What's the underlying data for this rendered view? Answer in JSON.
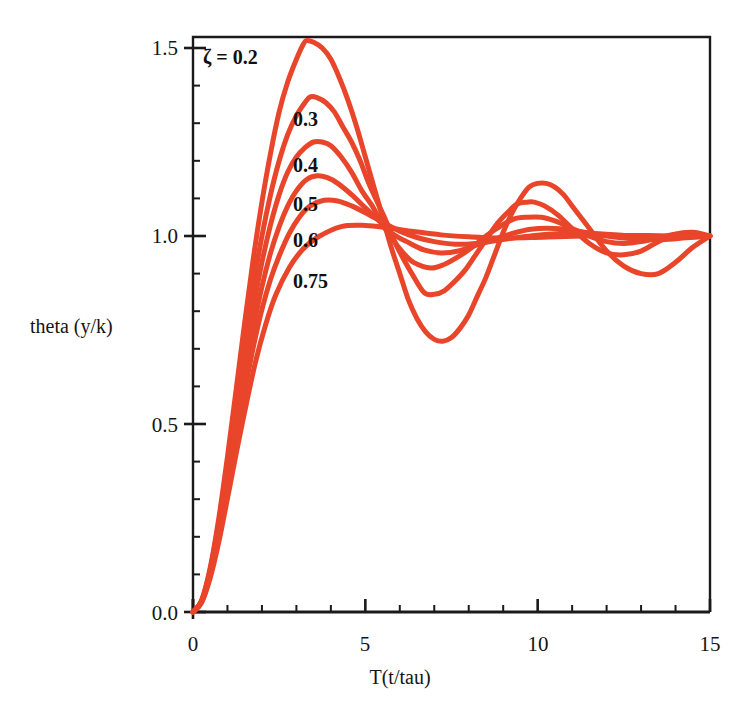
{
  "figure": {
    "background_color": "#ffffff",
    "frame_color": "#1a1a1a",
    "curve_color": "#E8452A"
  },
  "axes": {
    "x_title": "T(t/tau)",
    "y_title": "theta (y/k)",
    "x_ticks": [
      "0",
      "5",
      "10",
      "15"
    ],
    "y_ticks": [
      "0.0",
      "0.5",
      "1.0",
      "1.5"
    ]
  },
  "annotations": {
    "legend_lead": "ζ = 0.2",
    "labels": [
      "0.3",
      "0.4",
      "0.5",
      "0.6",
      "0.75"
    ]
  },
  "chart_data": {
    "type": "line",
    "title": "",
    "xlabel": "T(t/tau)",
    "ylabel": "theta (y/k)",
    "xlim": [
      0,
      15
    ],
    "ylim": [
      0.0,
      1.53
    ],
    "xticks": [
      0,
      5,
      10,
      15
    ],
    "yticks": [
      0.0,
      0.5,
      1.0,
      1.5
    ],
    "x_minor_tick_step": 1,
    "y_minor_tick_step": 0.1,
    "grid": false,
    "legend": "inline-curve-labels",
    "legend_position": "upper-left-inline",
    "color": "#E8452A",
    "line_width": 5,
    "series": [
      {
        "name": "0.2",
        "zeta": 0.2,
        "label": "ζ = 0.2",
        "peak_value": 1.52,
        "peak_time": 3.3,
        "trough_value": 0.72,
        "trough_time": 6.5,
        "second_peak_value": 1.14,
        "second_peak_time": 9.7,
        "x": [
          0,
          0.25,
          0.5,
          0.75,
          1,
          1.25,
          1.5,
          1.75,
          2,
          2.25,
          2.5,
          2.75,
          3,
          3.2,
          3.3,
          3.5,
          3.75,
          4,
          4.25,
          4.5,
          4.75,
          5,
          5.25,
          5.5,
          5.75,
          6,
          6.25,
          6.5,
          6.75,
          7,
          7.25,
          7.5,
          7.75,
          8,
          8.25,
          8.5,
          8.75,
          9,
          9.25,
          9.5,
          9.75,
          10,
          10.25,
          10.5,
          10.75,
          11,
          11.5,
          12,
          12.5,
          13,
          13.5,
          14,
          14.5,
          15
        ],
        "y": [
          0.0,
          0.031,
          0.118,
          0.25,
          0.413,
          0.59,
          0.77,
          0.94,
          1.09,
          1.22,
          1.33,
          1.41,
          1.47,
          1.51,
          1.52,
          1.515,
          1.5,
          1.47,
          1.42,
          1.36,
          1.29,
          1.21,
          1.13,
          1.05,
          0.97,
          0.9,
          0.83,
          0.78,
          0.745,
          0.725,
          0.72,
          0.73,
          0.755,
          0.79,
          0.84,
          0.89,
          0.95,
          1.01,
          1.06,
          1.1,
          1.13,
          1.14,
          1.14,
          1.13,
          1.11,
          1.08,
          1.02,
          0.96,
          0.92,
          0.9,
          0.9,
          0.93,
          0.97,
          1.0
        ]
      },
      {
        "name": "0.3",
        "zeta": 0.3,
        "peak_value": 1.37,
        "peak_time": 3.4,
        "trough_value": 0.84,
        "trough_time": 6.7,
        "second_peak_value": 1.09,
        "second_peak_time": 9.9,
        "x": [
          0,
          0.25,
          0.5,
          0.75,
          1,
          1.25,
          1.5,
          1.75,
          2,
          2.25,
          2.5,
          2.75,
          3,
          3.25,
          3.4,
          3.6,
          3.85,
          4.1,
          4.35,
          4.6,
          4.85,
          5.1,
          5.35,
          5.6,
          5.85,
          6.1,
          6.35,
          6.7,
          7,
          7.3,
          7.6,
          7.9,
          8.2,
          8.5,
          8.8,
          9.1,
          9.4,
          9.7,
          9.9,
          10.2,
          10.6,
          11,
          11.5,
          12,
          12.5,
          13,
          13.5,
          14,
          14.5,
          15
        ],
        "y": [
          0.0,
          0.03,
          0.113,
          0.238,
          0.39,
          0.554,
          0.717,
          0.869,
          1.0,
          1.11,
          1.2,
          1.27,
          1.32,
          1.355,
          1.37,
          1.368,
          1.355,
          1.33,
          1.29,
          1.25,
          1.2,
          1.14,
          1.09,
          1.04,
          0.985,
          0.94,
          0.9,
          0.85,
          0.845,
          0.855,
          0.88,
          0.91,
          0.95,
          0.99,
          1.03,
          1.06,
          1.085,
          1.09,
          1.09,
          1.08,
          1.055,
          1.02,
          0.98,
          0.955,
          0.95,
          0.96,
          0.985,
          1.005,
          1.01,
          1.0
        ]
      },
      {
        "name": "0.4",
        "zeta": 0.4,
        "peak_value": 1.25,
        "peak_time": 3.5,
        "trough_value": 0.915,
        "trough_time": 6.9,
        "second_peak_value": 1.05,
        "second_peak_time": 10.1,
        "x": [
          0,
          0.25,
          0.5,
          0.75,
          1,
          1.25,
          1.5,
          1.75,
          2,
          2.25,
          2.5,
          2.75,
          3,
          3.25,
          3.5,
          3.75,
          4,
          4.3,
          4.6,
          4.9,
          5.2,
          5.5,
          5.8,
          6.1,
          6.4,
          6.9,
          7.3,
          7.7,
          8.1,
          8.5,
          8.9,
          9.3,
          9.7,
          10.1,
          10.5,
          11,
          11.5,
          12,
          12.5,
          13,
          13.5,
          14,
          14.5,
          15
        ],
        "y": [
          0.0,
          0.029,
          0.108,
          0.226,
          0.369,
          0.52,
          0.67,
          0.81,
          0.93,
          1.03,
          1.11,
          1.17,
          1.21,
          1.235,
          1.25,
          1.25,
          1.24,
          1.21,
          1.17,
          1.12,
          1.08,
          1.03,
          0.99,
          0.955,
          0.93,
          0.915,
          0.925,
          0.945,
          0.97,
          1.0,
          1.025,
          1.045,
          1.05,
          1.05,
          1.04,
          1.02,
          1.0,
          0.985,
          0.98,
          0.985,
          0.995,
          1.005,
          1.005,
          1.0
        ]
      },
      {
        "name": "0.5",
        "zeta": 0.5,
        "peak_value": 1.16,
        "peak_time": 3.6,
        "trough_value": 0.955,
        "trough_time": 7.2,
        "second_peak_value": 1.02,
        "second_peak_time": 10.5,
        "x": [
          0,
          0.25,
          0.5,
          0.75,
          1,
          1.25,
          1.5,
          1.75,
          2,
          2.25,
          2.5,
          2.75,
          3,
          3.3,
          3.6,
          3.9,
          4.2,
          4.6,
          5,
          5.4,
          5.8,
          6.2,
          6.7,
          7.2,
          7.7,
          8.2,
          8.7,
          9.2,
          9.8,
          10.5,
          11.2,
          12,
          12.8,
          13.6,
          14.3,
          15
        ],
        "y": [
          0.0,
          0.028,
          0.103,
          0.214,
          0.348,
          0.49,
          0.625,
          0.755,
          0.865,
          0.955,
          1.025,
          1.08,
          1.12,
          1.15,
          1.16,
          1.155,
          1.14,
          1.11,
          1.075,
          1.04,
          1.005,
          0.985,
          0.963,
          0.955,
          0.96,
          0.975,
          0.99,
          1.005,
          1.018,
          1.02,
          1.013,
          1.0,
          0.992,
          0.99,
          0.995,
          1.0
        ]
      },
      {
        "name": "0.6",
        "zeta": 0.6,
        "peak_value": 1.095,
        "peak_time": 3.8,
        "trough_value": 0.978,
        "trough_time": 7.6,
        "second_peak_value": 1.008,
        "second_peak_time": 11.0,
        "x": [
          0,
          0.25,
          0.5,
          0.75,
          1,
          1.25,
          1.5,
          1.75,
          2,
          2.25,
          2.5,
          2.8,
          3.1,
          3.4,
          3.8,
          4.2,
          4.6,
          5,
          5.5,
          6,
          6.5,
          7,
          7.6,
          8.2,
          8.8,
          9.5,
          10.2,
          11,
          11.8,
          12.6,
          13.5,
          14.2,
          15
        ],
        "y": [
          0.0,
          0.027,
          0.098,
          0.203,
          0.33,
          0.462,
          0.588,
          0.705,
          0.805,
          0.885,
          0.947,
          1.008,
          1.052,
          1.08,
          1.095,
          1.093,
          1.08,
          1.062,
          1.037,
          1.013,
          0.996,
          0.985,
          0.978,
          0.98,
          0.988,
          0.997,
          1.004,
          1.008,
          1.006,
          1.001,
          0.997,
          0.998,
          1.0
        ]
      },
      {
        "name": "0.75",
        "zeta": 0.75,
        "peak_value": 1.028,
        "peak_time": 4.3,
        "trough_value": 0.995,
        "trough_time": 8.8,
        "second_peak_value": 1.001,
        "second_peak_time": 13.0,
        "x": [
          0,
          0.25,
          0.5,
          0.75,
          1,
          1.25,
          1.5,
          1.8,
          2.1,
          2.4,
          2.8,
          3.2,
          3.6,
          4.3,
          5,
          5.7,
          6.4,
          7.2,
          8,
          8.8,
          9.8,
          10.8,
          12,
          13.2,
          14.1,
          15
        ],
        "y": [
          0.0,
          0.025,
          0.091,
          0.187,
          0.302,
          0.42,
          0.533,
          0.66,
          0.762,
          0.843,
          0.917,
          0.966,
          0.996,
          1.025,
          1.028,
          1.021,
          1.012,
          1.003,
          0.998,
          0.995,
          0.996,
          0.999,
          1.001,
          1.001,
          1.0,
          1.0
        ]
      }
    ]
  }
}
